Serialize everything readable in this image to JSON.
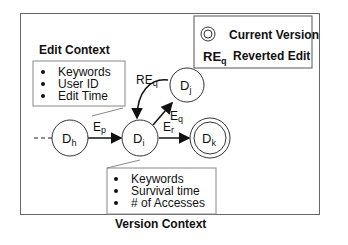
{
  "legend": {
    "current_version_label": "Current Version",
    "reverted_edit_symbol": "RE",
    "reverted_edit_sub": "q",
    "reverted_edit_label": "Reverted Edit"
  },
  "edit_context": {
    "title": "Edit Context",
    "items": [
      "Keywords",
      "User ID",
      "Edit Time"
    ]
  },
  "version_context": {
    "title": "Version Context",
    "items": [
      "Keywords",
      "Survival time",
      "# of Accesses"
    ]
  },
  "nodes": [
    {
      "id": "h",
      "label": "D",
      "sub": "h"
    },
    {
      "id": "i",
      "label": "D",
      "sub": "i"
    },
    {
      "id": "j",
      "label": "D",
      "sub": "j"
    },
    {
      "id": "k",
      "label": "D",
      "sub": "k",
      "current": true
    }
  ],
  "edges": [
    {
      "from": "h",
      "to": "i",
      "label": "E",
      "sub": "p"
    },
    {
      "from": "i",
      "to": "j",
      "label": "E",
      "sub": "q"
    },
    {
      "from": "j",
      "to": "i",
      "label": "RE",
      "sub": "q"
    },
    {
      "from": "i",
      "to": "k",
      "label": "E",
      "sub": "r"
    }
  ]
}
